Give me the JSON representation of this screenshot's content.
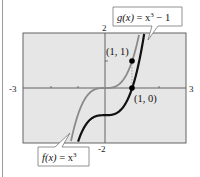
{
  "chart_data": {
    "type": "line",
    "title": "",
    "xlabel": "",
    "ylabel": "",
    "xlim": [
      -3,
      3
    ],
    "ylim": [
      -2,
      2
    ],
    "grid": false,
    "x_tick_labels": [
      "-3",
      "3"
    ],
    "y_tick_labels": [
      "2",
      "-2"
    ],
    "series": [
      {
        "name": "f(x) = x^3",
        "color": "#8a8a8a",
        "x": [
          -1.26,
          -1,
          -0.5,
          0,
          0.5,
          1,
          1.26
        ],
        "values": [
          -2,
          -1,
          -0.125,
          0,
          0.125,
          1,
          2
        ]
      },
      {
        "name": "g(x) = x^3 - 1",
        "color": "#111111",
        "x": [
          -1,
          -0.5,
          0,
          0.5,
          1,
          1.44
        ],
        "values": [
          -2,
          -1.125,
          -1,
          -0.875,
          0,
          2
        ]
      }
    ],
    "points": [
      {
        "label": "(1, 1)",
        "x": 1,
        "y": 1
      },
      {
        "label": "(1, 0)",
        "x": 1,
        "y": 0
      }
    ],
    "annotations": {
      "g_label": {
        "fn": "g(x)",
        "eq": " = x",
        "exp": "3",
        "rest": " − 1"
      },
      "f_label": {
        "fn": "f(x)",
        "eq": " = x",
        "exp": "3",
        "rest": ""
      },
      "point_1_1": "(1, 1)",
      "point_1_0": "(1, 0)"
    },
    "colors": {
      "plot_bg": "#e6e6e6",
      "axis": "#555555",
      "f_curve": "#8a8a8a",
      "g_curve": "#111111"
    }
  }
}
